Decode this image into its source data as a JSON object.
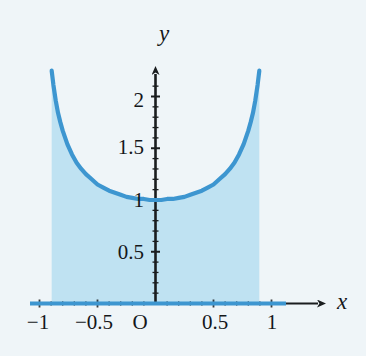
{
  "chart_data": {
    "type": "line",
    "title": "",
    "subtitle": "",
    "xlabel": "x",
    "ylabel": "y",
    "xlim": [
      -1.12,
      1.22
    ],
    "ylim": [
      -0.12,
      2.45
    ],
    "grid": false,
    "legend": null,
    "annotations": [],
    "origin_label": "O",
    "x_ticks": [
      {
        "value": -1,
        "label": "−1"
      },
      {
        "value": -0.5,
        "label": "−0.5"
      },
      {
        "value": 0,
        "label": "O"
      },
      {
        "value": 0.5,
        "label": "0.5"
      },
      {
        "value": 1,
        "label": "1"
      }
    ],
    "y_ticks": [
      {
        "value": 0.5,
        "label": "0.5"
      },
      {
        "value": 1,
        "label": "1"
      },
      {
        "value": 1.5,
        "label": "1.5"
      },
      {
        "value": 2,
        "label": "2"
      }
    ],
    "y_minor_tick_step": 0.1,
    "x_minor_tick_step": 0.1,
    "series": [
      {
        "name": "y = 1 / sqrt(1 - x^2)",
        "shaded_area": true,
        "x": [
          -0.895,
          -0.88,
          -0.86,
          -0.84,
          -0.82,
          -0.8,
          -0.76,
          -0.72,
          -0.68,
          -0.64,
          -0.6,
          -0.55,
          -0.5,
          -0.45,
          -0.4,
          -0.35,
          -0.3,
          -0.25,
          -0.2,
          -0.15,
          -0.1,
          -0.05,
          0,
          0.05,
          0.1,
          0.15,
          0.2,
          0.25,
          0.3,
          0.35,
          0.4,
          0.45,
          0.5,
          0.55,
          0.6,
          0.64,
          0.68,
          0.72,
          0.76,
          0.8,
          0.82,
          0.84,
          0.86,
          0.88,
          0.895
        ],
        "y": [
          2.25,
          2.11,
          1.96,
          1.84,
          1.75,
          1.67,
          1.54,
          1.44,
          1.36,
          1.3,
          1.25,
          1.2,
          1.15,
          1.12,
          1.09,
          1.07,
          1.05,
          1.03,
          1.02,
          1.01,
          1.01,
          1.0,
          1.0,
          1.0,
          1.01,
          1.01,
          1.02,
          1.03,
          1.05,
          1.07,
          1.09,
          1.12,
          1.15,
          1.2,
          1.25,
          1.3,
          1.36,
          1.44,
          1.54,
          1.67,
          1.75,
          1.84,
          1.96,
          2.11,
          2.25
        ]
      }
    ],
    "colors": {
      "curve": "#3d96d0",
      "fill": "#bfe2f2",
      "axis": "#1a1d1f",
      "baseline": "#3d96d0",
      "background": "#eff5f8",
      "text": "#14171a"
    }
  }
}
